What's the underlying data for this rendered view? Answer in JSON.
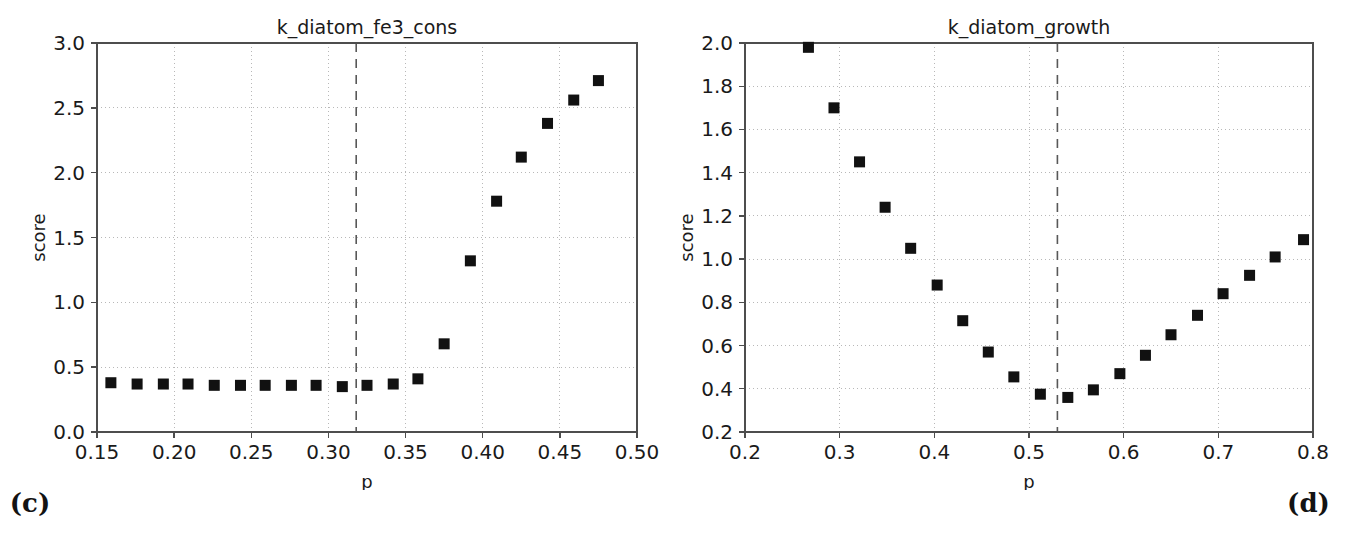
{
  "figure": {
    "background": "#ffffff",
    "marker_color": "#111111",
    "axis_color": "#4d4d4d",
    "grid_color": "#b8b8b8",
    "vline_color": "#585858"
  },
  "panels": [
    {
      "caption": "(c)",
      "chart_data": {
        "type": "scatter",
        "title": "k_diatom_fe3_cons",
        "xlabel": "p",
        "ylabel": "score",
        "xlim": [
          0.15,
          0.5
        ],
        "ylim": [
          0.0,
          3.0
        ],
        "xticks": [
          0.15,
          0.2,
          0.25,
          0.3,
          0.35,
          0.4,
          0.45,
          0.5
        ],
        "xticklabels": [
          "0.15",
          "0.20",
          "0.25",
          "0.30",
          "0.35",
          "0.40",
          "0.45",
          "0.50"
        ],
        "yticks": [
          0.0,
          0.5,
          1.0,
          1.5,
          2.0,
          2.5,
          3.0
        ],
        "yticklabels": [
          "0.0",
          "0.5",
          "1.0",
          "1.5",
          "2.0",
          "2.5",
          "3.0"
        ],
        "grid": true,
        "legend": null,
        "vline": 0.318,
        "vline_style": "dashed",
        "marker": "square",
        "x": [
          0.159,
          0.176,
          0.193,
          0.209,
          0.226,
          0.243,
          0.259,
          0.276,
          0.292,
          0.309,
          0.325,
          0.342,
          0.358,
          0.375,
          0.392,
          0.409,
          0.425,
          0.442,
          0.459,
          0.475
        ],
        "y": [
          0.38,
          0.37,
          0.37,
          0.37,
          0.36,
          0.36,
          0.36,
          0.36,
          0.36,
          0.35,
          0.36,
          0.37,
          0.41,
          0.68,
          1.32,
          1.78,
          2.12,
          2.38,
          2.56,
          2.71
        ]
      }
    },
    {
      "caption": "(d)",
      "chart_data": {
        "type": "scatter",
        "title": "k_diatom_growth",
        "xlabel": "p",
        "ylabel": "score",
        "xlim": [
          0.2,
          0.8
        ],
        "ylim": [
          0.2,
          2.0
        ],
        "xticks": [
          0.2,
          0.3,
          0.4,
          0.5,
          0.6,
          0.7,
          0.8
        ],
        "xticklabels": [
          "0.2",
          "0.3",
          "0.4",
          "0.5",
          "0.6",
          "0.7",
          "0.8"
        ],
        "yticks": [
          0.2,
          0.4,
          0.6,
          0.8,
          1.0,
          1.2,
          1.4,
          1.6,
          1.8,
          2.0
        ],
        "yticklabels": [
          "0.2",
          "0.4",
          "0.6",
          "0.8",
          "1.0",
          "1.2",
          "1.4",
          "1.6",
          "1.8",
          "2.0"
        ],
        "grid": true,
        "legend": null,
        "vline": 0.53,
        "vline_style": "dashed",
        "marker": "square",
        "x": [
          0.267,
          0.294,
          0.321,
          0.348,
          0.375,
          0.403,
          0.43,
          0.457,
          0.484,
          0.512,
          0.541,
          0.568,
          0.596,
          0.623,
          0.65,
          0.678,
          0.705,
          0.733,
          0.76,
          0.79
        ],
        "y": [
          1.98,
          1.7,
          1.45,
          1.24,
          1.05,
          0.88,
          0.715,
          0.57,
          0.455,
          0.375,
          0.36,
          0.395,
          0.47,
          0.555,
          0.65,
          0.74,
          0.84,
          0.925,
          1.01,
          1.09
        ]
      }
    }
  ]
}
